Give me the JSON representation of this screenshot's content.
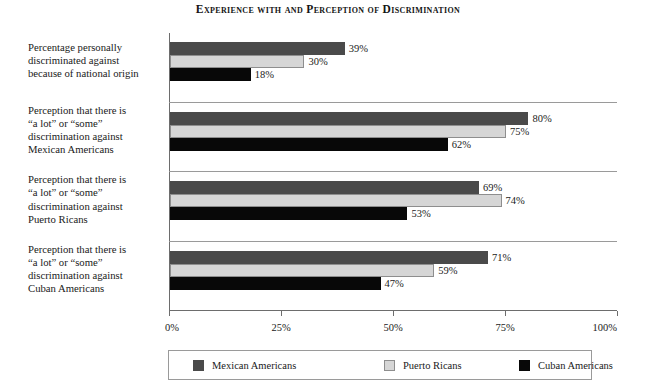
{
  "chart_data": {
    "type": "bar",
    "orientation": "horizontal",
    "title": "Experience with and Perception of Discrimination",
    "xlabel": "",
    "ylabel": "",
    "xlim": [
      0,
      100
    ],
    "xticks": [
      "0%",
      "25%",
      "50%",
      "75%",
      "100%"
    ],
    "xtick_values": [
      0,
      25,
      50,
      75,
      100
    ],
    "grid": false,
    "legend_position": "bottom",
    "categories": [
      "Percentage personally discriminated against because of national origin",
      "Perception that there is “a lot” or “some” discrimination against Mexican Americans",
      "Perception that there is “a lot” or “some” discrimination against Puerto Ricans",
      "Perception that there is “a lot” or “some” discrimination against Cuban Americans"
    ],
    "category_lines": [
      [
        "Percentage personally",
        "discriminated against",
        "because of national origin"
      ],
      [
        "Perception that there is",
        "“a lot” or “some”",
        "discrimination against",
        "Mexican Americans"
      ],
      [
        "Perception that there is",
        "“a lot” or “some”",
        "discrimination against",
        "Puerto Ricans"
      ],
      [
        "Perception that there is",
        "“a lot” or “some”",
        "discrimination against",
        "Cuban Americans"
      ]
    ],
    "series": [
      {
        "name": "Mexican Americans",
        "color": "#4a4a4a",
        "values": [
          39,
          80,
          69,
          71
        ],
        "labels": [
          "39%",
          "80%",
          "69%",
          "71%"
        ]
      },
      {
        "name": "Puerto Ricans",
        "color": "#d6d6d6",
        "values": [
          30,
          75,
          74,
          59
        ],
        "labels": [
          "30%",
          "75%",
          "74%",
          "59%"
        ]
      },
      {
        "name": "Cuban Americans",
        "color": "#080808",
        "values": [
          18,
          62,
          53,
          47
        ],
        "labels": [
          "18%",
          "62%",
          "53%",
          "47%"
        ]
      }
    ]
  },
  "legend": {
    "items": [
      {
        "label": "Mexican Americans",
        "swatch": "dark-gray-swatch"
      },
      {
        "label": "Puerto Ricans",
        "swatch": "light-gray-swatch"
      },
      {
        "label": "Cuban Americans",
        "swatch": "black-swatch"
      }
    ]
  }
}
